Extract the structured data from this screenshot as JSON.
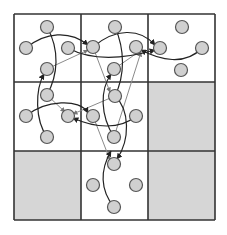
{
  "diagram": {
    "type": "grid-graph",
    "grid": {
      "rows": 3,
      "cols": 3,
      "x_lines": [
        14,
        81,
        148,
        215
      ],
      "y_lines": [
        14,
        82,
        151,
        220
      ],
      "line_color": "#333333",
      "cell_fill": "#ffffff",
      "shaded_fill": "#d6d6d6",
      "shaded_cells": [
        [
          1,
          2
        ],
        [
          2,
          0
        ],
        [
          2,
          2
        ]
      ]
    },
    "node_style": {
      "radius": 6.5,
      "fill": "#d0d0d0",
      "stroke": "#555555"
    },
    "nodes": [
      {
        "id": "a1",
        "x": 47,
        "y": 27
      },
      {
        "id": "a2",
        "x": 26,
        "y": 48
      },
      {
        "id": "a3",
        "x": 68,
        "y": 48
      },
      {
        "id": "a4",
        "x": 47,
        "y": 69
      },
      {
        "id": "b1",
        "x": 115,
        "y": 27
      },
      {
        "id": "b2",
        "x": 93,
        "y": 47
      },
      {
        "id": "b3",
        "x": 136,
        "y": 47
      },
      {
        "id": "b4",
        "x": 114,
        "y": 69
      },
      {
        "id": "c1",
        "x": 182,
        "y": 27
      },
      {
        "id": "c2",
        "x": 160,
        "y": 48
      },
      {
        "id": "c3",
        "x": 202,
        "y": 48
      },
      {
        "id": "c4",
        "x": 181,
        "y": 70
      },
      {
        "id": "d1",
        "x": 47,
        "y": 95
      },
      {
        "id": "d2",
        "x": 26,
        "y": 116
      },
      {
        "id": "d3",
        "x": 68,
        "y": 116
      },
      {
        "id": "d4",
        "x": 47,
        "y": 137
      },
      {
        "id": "e1",
        "x": 115,
        "y": 96
      },
      {
        "id": "e2",
        "x": 93,
        "y": 116
      },
      {
        "id": "e3",
        "x": 136,
        "y": 116
      },
      {
        "id": "e4",
        "x": 114,
        "y": 137
      },
      {
        "id": "g1",
        "x": 114,
        "y": 164
      },
      {
        "id": "g2",
        "x": 93,
        "y": 185
      },
      {
        "id": "g3",
        "x": 136,
        "y": 185
      },
      {
        "id": "g4",
        "x": 114,
        "y": 207
      }
    ],
    "edges_black": [
      {
        "d": "M26,48 C45,32 70,30 88,45"
      },
      {
        "d": "M47,27 C60,50 58,75 47,95"
      },
      {
        "d": "M93,47 C115,28 140,28 155,45"
      },
      {
        "d": "M202,48 C185,66 160,60 141,50"
      },
      {
        "d": "M68,48 C90,60 120,60 155,50"
      },
      {
        "d": "M115,27 C125,50 125,75 115,96"
      },
      {
        "d": "M47,137 C35,120 35,90 44,74"
      },
      {
        "d": "M26,116 C45,100 80,98 88,113"
      },
      {
        "d": "M136,116 C120,130 95,128 73,118"
      },
      {
        "d": "M114,137 C100,115 100,90 111,74"
      },
      {
        "d": "M114,207 C100,190 100,170 111,151"
      },
      {
        "d": "M115,96 C130,110 130,140 117,159"
      }
    ],
    "edges_grey": [
      {
        "d": "M47,69 L88,50"
      },
      {
        "d": "M114,69 L140,51"
      },
      {
        "d": "M93,47 L110,92"
      },
      {
        "d": "M115,96 L73,114"
      },
      {
        "d": "M47,95 L65,112"
      },
      {
        "d": "M93,116 L110,160"
      },
      {
        "d": "M114,137 L141,52"
      }
    ]
  }
}
